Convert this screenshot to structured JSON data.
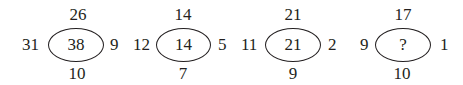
{
  "puzzle": {
    "groups": [
      {
        "top": "26",
        "left": "31",
        "center": "38",
        "right": "9",
        "bottom": "10"
      },
      {
        "top": "14",
        "left": "12",
        "center": "14",
        "right": "5",
        "bottom": "7"
      },
      {
        "top": "21",
        "left": "11",
        "center": "21",
        "right": "2",
        "bottom": "9"
      },
      {
        "top": "17",
        "left": "9",
        "center": "?",
        "right": "1",
        "bottom": "10"
      }
    ]
  }
}
